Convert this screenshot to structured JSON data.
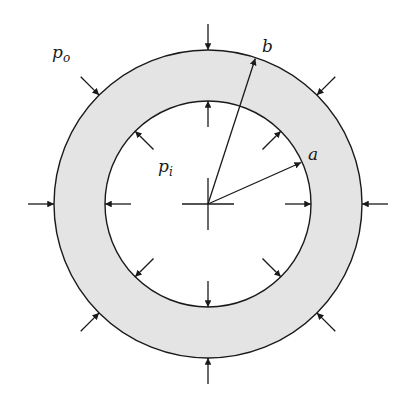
{
  "diagram": {
    "colors": {
      "ring_fill": "#e4e4e4",
      "stroke": "#1a1a1a",
      "background": "#ffffff"
    },
    "geometry": {
      "center": [
        208,
        204
      ],
      "outer_radius": 154,
      "inner_radius": 103
    },
    "labels": {
      "outer_pressure": {
        "base": "p",
        "sub": "o"
      },
      "inner_pressure": {
        "base": "p",
        "sub": "i"
      },
      "outer_radius": "b",
      "inner_radius": "a"
    },
    "arrows": {
      "outer_angles_deg": [
        0,
        45,
        90,
        135,
        180,
        225,
        270,
        315
      ],
      "inner_angles_deg": [
        0,
        45,
        90,
        135,
        180,
        225,
        270,
        315
      ],
      "radius_b_angle_deg": -72,
      "radius_a_angle_deg": -24
    }
  }
}
